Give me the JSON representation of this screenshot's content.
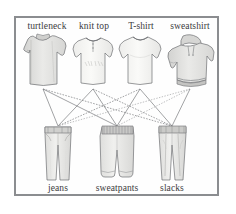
{
  "figure": {
    "kind": "bipartite-outfit-combination-diagram",
    "background_color": "#ffffff",
    "frame_color": "#8b8d90",
    "label_color": "#3b3b3d",
    "edge_color": "#6f7174",
    "garment_fill": "#e2e2e0",
    "garment_light_fill": "#f2f2f0",
    "garment_stroke": "#6e7073"
  },
  "tops": [
    {
      "id": "turtleneck",
      "label": "turtleneck",
      "label_x": 47,
      "node_x": 43,
      "node_y": 89
    },
    {
      "id": "knit-top",
      "label": "knit top",
      "label_x": 94,
      "node_x": 93,
      "node_y": 89
    },
    {
      "id": "t-shirt",
      "label": "T-shirt",
      "label_x": 141,
      "node_x": 140,
      "node_y": 89
    },
    {
      "id": "sweatshirt",
      "label": "sweatshirt",
      "label_x": 190,
      "node_x": 190,
      "node_y": 89
    }
  ],
  "bottoms": [
    {
      "id": "jeans",
      "label": "jeans",
      "label_x": 58,
      "node_x": 58,
      "node_y": 126
    },
    {
      "id": "sweatpants",
      "label": "sweatpants",
      "label_x": 117,
      "node_x": 117,
      "node_y": 126
    },
    {
      "id": "slacks",
      "label": "slacks",
      "label_x": 172,
      "node_x": 172,
      "node_y": 126
    }
  ],
  "edges": [
    {
      "from": "turtleneck",
      "to": "jeans"
    },
    {
      "from": "turtleneck",
      "to": "sweatpants"
    },
    {
      "from": "turtleneck",
      "to": "slacks"
    },
    {
      "from": "knit-top",
      "to": "jeans"
    },
    {
      "from": "knit-top",
      "to": "sweatpants"
    },
    {
      "from": "knit-top",
      "to": "slacks"
    },
    {
      "from": "t-shirt",
      "to": "jeans"
    },
    {
      "from": "t-shirt",
      "to": "sweatpants"
    },
    {
      "from": "t-shirt",
      "to": "slacks"
    },
    {
      "from": "sweatshirt",
      "to": "jeans"
    },
    {
      "from": "sweatshirt",
      "to": "sweatpants"
    },
    {
      "from": "sweatshirt",
      "to": "slacks"
    }
  ],
  "edge_count": 12
}
